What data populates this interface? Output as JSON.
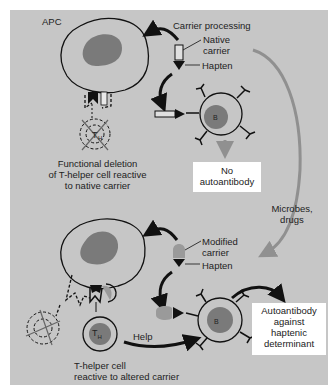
{
  "colors": {
    "background": "#c6c6c6",
    "nucleus": "#7a7a7a",
    "outline": "#111111",
    "modified_carrier": "#9a9a9a",
    "microbes_arrow": "#909090",
    "box_fill": "#ffffff"
  },
  "top_panel": {
    "apc_label": "APC",
    "carrier_processing_label": "Carrier processing",
    "native_carrier_label": "Native\ncarrier",
    "native_carrier_line1": "Native",
    "native_carrier_line2": "carrier",
    "hapten_label": "Hapten",
    "b_cell_label": "B",
    "t_cell_label": "TH",
    "deletion_caption": [
      "Functional deletion",
      "of T-helper cell reactive",
      "to native carrier"
    ],
    "outcome_box": [
      "No",
      "autoantibody"
    ]
  },
  "side": {
    "microbes_label": [
      "Microbes,",
      "drugs"
    ]
  },
  "bottom_panel": {
    "modified_carrier_line1": "Modified",
    "modified_carrier_line2": "carrier",
    "hapten_label": "Hapten",
    "help_label": "Help",
    "b_cell_label": "B",
    "t_cell_label_main": "T",
    "t_cell_label_sub": "H",
    "t_cell_caption": [
      "T-helper cell",
      "reactive to altered carrier"
    ],
    "outcome_box": [
      "Autoantibody",
      "against",
      "haptenic",
      "determinant"
    ]
  }
}
